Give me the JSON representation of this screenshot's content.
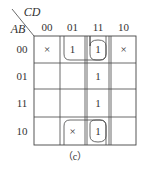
{
  "kmap": {
    "row_var": "AB",
    "col_var": "CD",
    "col_labels": [
      "00",
      "01",
      "11",
      "10"
    ],
    "row_labels": [
      "00",
      "01",
      "11",
      "10"
    ],
    "cells": [
      [
        "×",
        "1",
        "1",
        ""
      ],
      [
        "",
        "",
        "1",
        ""
      ],
      [
        "",
        "",
        "1",
        ""
      ],
      [
        "",
        "×",
        "1",
        ""
      ]
    ],
    "cells_r0": [
      "×",
      "1",
      "1",
      "×"
    ],
    "caption": "（c）",
    "groups": [
      "Column CD=11 (all rows)",
      "Row AB=00, columns 01-11",
      "Row AB=00 col 11 single loop",
      "Row AB=10, columns 01-11",
      "Row AB=10 col 11 single loop"
    ]
  }
}
